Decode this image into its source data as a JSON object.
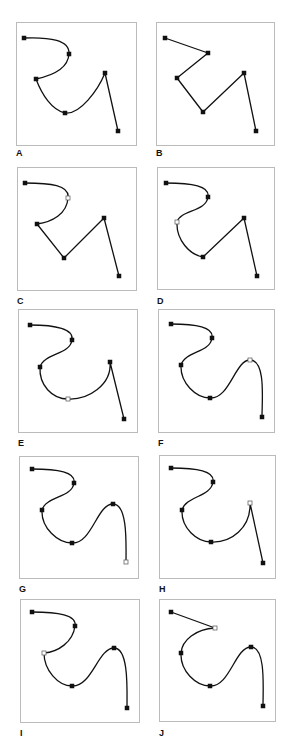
{
  "figure": {
    "border_color": "#bbbbbb",
    "stroke_color": "#111111",
    "anchor_fill": "#111111",
    "open_anchor_fill": "#ffffff",
    "panels": [
      {
        "label": "A",
        "box": [
          16,
          22,
          120,
          123
        ],
        "label_pos": [
          16,
          148
        ],
        "path": "M24,38 C50,37 70,40 69,54 C68,70 50,76 36,79 C42,95 52,110 65,113 C80,115 98,90 105,73 L118,131",
        "anchors": [
          [
            24,
            38,
            "solid"
          ],
          [
            69,
            54,
            "solid"
          ],
          [
            36,
            79,
            "solid"
          ],
          [
            65,
            113,
            "solid"
          ],
          [
            105,
            73,
            "solid"
          ],
          [
            118,
            131,
            "solid"
          ]
        ]
      },
      {
        "label": "B",
        "box": [
          156,
          22,
          118,
          123
        ],
        "label_pos": [
          156,
          148
        ],
        "path": "M165,38 L208,53 L177,78 L203,112 L244,73 L256,131",
        "anchors": [
          [
            165,
            38,
            "solid"
          ],
          [
            208,
            53,
            "solid"
          ],
          [
            177,
            78,
            "solid"
          ],
          [
            203,
            112,
            "solid"
          ],
          [
            244,
            73,
            "solid"
          ],
          [
            256,
            131,
            "solid"
          ]
        ]
      },
      {
        "label": "C",
        "box": [
          17,
          167,
          119,
          123
        ],
        "label_pos": [
          17,
          296
        ],
        "path": "M25,183 C50,183 70,185 68,198 C67,214 52,222 37,224 L64,258 L104,218 L119,276",
        "anchors": [
          [
            25,
            183,
            "solid"
          ],
          [
            68,
            198,
            "open"
          ],
          [
            37,
            224,
            "solid"
          ],
          [
            64,
            258,
            "solid"
          ],
          [
            104,
            218,
            "solid"
          ],
          [
            119,
            276,
            "solid"
          ]
        ]
      },
      {
        "label": "D",
        "box": [
          157,
          167,
          117,
          122
        ],
        "label_pos": [
          157,
          296
        ],
        "path": "M166,183 C192,183 210,186 208,197 C206,212 180,210 177,222 C176,240 190,255 203,257 L244,218 L257,276",
        "anchors": [
          [
            166,
            183,
            "solid"
          ],
          [
            208,
            197,
            "solid"
          ],
          [
            177,
            222,
            "open"
          ],
          [
            203,
            257,
            "solid"
          ],
          [
            244,
            218,
            "solid"
          ],
          [
            257,
            276,
            "solid"
          ]
        ]
      },
      {
        "label": "E",
        "box": [
          18,
          309,
          119,
          123
        ],
        "label_pos": [
          18,
          438
        ],
        "path": "M30,325 C56,325 74,329 72,340 C70,355 44,353 40,367 C39,385 52,399 68,399 C88,400 112,385 110,362 L124,419",
        "anchors": [
          [
            30,
            325,
            "solid"
          ],
          [
            72,
            340,
            "solid"
          ],
          [
            40,
            367,
            "solid"
          ],
          [
            68,
            399,
            "open"
          ],
          [
            110,
            362,
            "solid"
          ],
          [
            124,
            419,
            "solid"
          ]
        ]
      },
      {
        "label": "F",
        "box": [
          158,
          309,
          116,
          123
        ],
        "label_pos": [
          158,
          438
        ],
        "path": "M171,324 C196,324 214,327 212,338 C210,353 185,351 181,365 C180,383 196,398 210,398 C230,399 235,360 250,360 C266,360 262,400 262,417",
        "anchors": [
          [
            171,
            324,
            "solid"
          ],
          [
            212,
            338,
            "solid"
          ],
          [
            181,
            365,
            "solid"
          ],
          [
            210,
            398,
            "solid"
          ],
          [
            250,
            360,
            "open"
          ],
          [
            262,
            417,
            "solid"
          ]
        ]
      },
      {
        "label": "G",
        "box": [
          19,
          456,
          119,
          122
        ],
        "label_pos": [
          19,
          584
        ],
        "path": "M32,469 C58,469 76,472 74,483 C72,498 46,496 42,510 C41,528 58,543 72,543 C92,544 97,504 113,504 C128,504 126,545 126,562",
        "anchors": [
          [
            32,
            469,
            "solid"
          ],
          [
            74,
            483,
            "solid"
          ],
          [
            42,
            510,
            "solid"
          ],
          [
            72,
            543,
            "solid"
          ],
          [
            113,
            504,
            "solid"
          ],
          [
            126,
            562,
            "open"
          ]
        ]
      },
      {
        "label": "H",
        "box": [
          159,
          455,
          116,
          123
        ],
        "label_pos": [
          159,
          584
        ],
        "path": "M171,468 C197,468 215,471 213,482 C211,497 186,496 182,510 C181,528 197,542 211,542 C231,543 251,528 250,503 L263,563",
        "anchors": [
          [
            171,
            468,
            "solid"
          ],
          [
            213,
            482,
            "solid"
          ],
          [
            182,
            510,
            "solid"
          ],
          [
            211,
            542,
            "solid"
          ],
          [
            250,
            503,
            "open"
          ],
          [
            263,
            563,
            "solid"
          ]
        ]
      },
      {
        "label": "I",
        "box": [
          20,
          599,
          119,
          123
        ],
        "label_pos": [
          20,
          728
        ],
        "path": "M32,612 C58,612 77,615 75,626 C73,642 58,652 44,653 C44,670 58,686 72,686 C92,687 98,648 114,648 C129,648 127,690 127,708",
        "anchors": [
          [
            32,
            612,
            "solid"
          ],
          [
            75,
            626,
            "solid"
          ],
          [
            44,
            653,
            "open"
          ],
          [
            72,
            686,
            "solid"
          ],
          [
            114,
            648,
            "solid"
          ],
          [
            127,
            708,
            "solid"
          ]
        ]
      },
      {
        "label": "J",
        "box": [
          159,
          599,
          116,
          122
        ],
        "label_pos": [
          159,
          728
        ],
        "path": "M171,612 L215,628 C196,629 182,640 181,653 C180,671 196,686 210,686 C230,687 235,647 251,647 C266,647 263,688 263,706",
        "anchors": [
          [
            171,
            612,
            "solid"
          ],
          [
            215,
            628,
            "open"
          ],
          [
            181,
            653,
            "solid"
          ],
          [
            210,
            686,
            "solid"
          ],
          [
            251,
            647,
            "solid"
          ],
          [
            263,
            706,
            "solid"
          ]
        ]
      }
    ]
  }
}
